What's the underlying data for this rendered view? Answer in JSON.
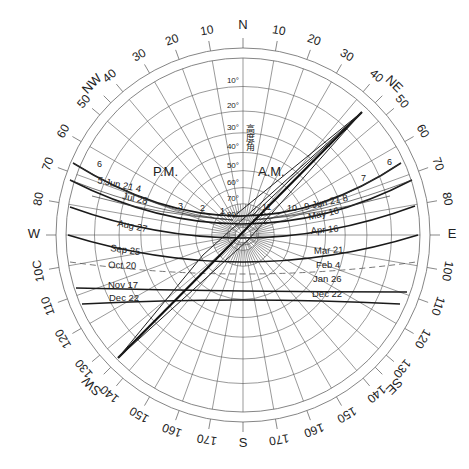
{
  "diagram": {
    "center": [
      243,
      235
    ],
    "outer_radius": 187,
    "inner_radius": 177,
    "compass_labels": [
      {
        "text": "N",
        "az": 0
      },
      {
        "text": "NE",
        "az": 45
      },
      {
        "text": "E",
        "az": 90
      },
      {
        "text": "SE",
        "az": 135
      },
      {
        "text": "S",
        "az": 180
      },
      {
        "text": "SW",
        "az": 225
      },
      {
        "text": "W",
        "az": 270
      },
      {
        "text": "NW",
        "az": 315
      }
    ],
    "azimuth_labels_east": [
      "10",
      "20",
      "30",
      "40",
      "50",
      "60",
      "70",
      "80",
      "100",
      "110",
      "120",
      "130",
      "140",
      "150",
      "160",
      "170"
    ],
    "azimuth_labels_west": [
      "10",
      "20",
      "30",
      "40",
      "50",
      "60",
      "70",
      "80",
      "10C",
      "110",
      "120",
      "130",
      "140",
      "150",
      "160",
      "170"
    ],
    "altitude_labels": [
      "10°",
      "20°",
      "30°",
      "40°",
      "50°",
      "60°",
      "70°",
      "80°"
    ],
    "altitude_axis_label": "高度角",
    "am_label": "A.M.",
    "pm_label": "P.M.",
    "date_labels_left": [
      {
        "text": "5 Jun 21 4",
        "x": 97,
        "y": 183,
        "rot": 12
      },
      {
        "text": "Jul 28",
        "x": 122,
        "y": 199,
        "rot": 12
      },
      {
        "text": "Aug 27",
        "x": 117,
        "y": 226,
        "rot": 12
      },
      {
        "text": "Sep 25",
        "x": 110,
        "y": 251,
        "rot": 8
      },
      {
        "text": "Oct 20",
        "x": 108,
        "y": 268,
        "rot": 2
      },
      {
        "text": "Nov 17",
        "x": 108,
        "y": 288,
        "rot": 0
      },
      {
        "text": "Dec 22",
        "x": 109,
        "y": 301,
        "rot": 0
      }
    ],
    "date_labels_right": [
      {
        "text": "9 Jun 21 8",
        "x": 305,
        "y": 210,
        "rot": -12
      },
      {
        "text": "May 16",
        "x": 309,
        "y": 220,
        "rot": -12
      },
      {
        "text": "Apr 16",
        "x": 311,
        "y": 234,
        "rot": -5
      },
      {
        "text": "Mar 21",
        "x": 314,
        "y": 254,
        "rot": -2
      },
      {
        "text": "Feb 4",
        "x": 316,
        "y": 268,
        "rot": 0
      },
      {
        "text": "Jan 26",
        "x": 313,
        "y": 282,
        "rot": 0
      },
      {
        "text": "Dec 22",
        "x": 312,
        "y": 297,
        "rot": 0
      }
    ],
    "hour_labels": [
      {
        "text": "6",
        "x": 97,
        "y": 167
      },
      {
        "text": "3",
        "x": 178,
        "y": 209
      },
      {
        "text": "2",
        "x": 200,
        "y": 211
      },
      {
        "text": "1",
        "x": 220,
        "y": 214
      },
      {
        "text": "11",
        "x": 262,
        "y": 210
      },
      {
        "text": "10",
        "x": 287,
        "y": 211
      },
      {
        "text": "7",
        "x": 361,
        "y": 181
      },
      {
        "text": "6",
        "x": 387,
        "y": 165
      }
    ]
  },
  "chart_data": {
    "type": "sun-path-diagram",
    "projection": "stereographic polar",
    "azimuth_range": [
      0,
      360
    ],
    "altitude_circles": [
      10,
      20,
      30,
      40,
      50,
      60,
      70,
      80
    ],
    "azimuth_gridlines_step": 10,
    "sun_paths": [
      {
        "date": "Jun 21",
        "left_end": [
          73,
          163
        ],
        "right_end": [
          401,
          163
        ],
        "low": [
          243,
          216
        ]
      },
      {
        "date": "Jul 28 / May 16",
        "left_end": [
          70,
          180
        ],
        "right_end": [
          412,
          180
        ],
        "low": [
          243,
          224
        ]
      },
      {
        "date": "Aug 27 / Apr 16",
        "left_end": [
          70,
          207
        ],
        "right_end": [
          415,
          206
        ],
        "low": [
          243,
          238
        ]
      },
      {
        "date": "Sep 25 / Mar 21",
        "left_end": [
          68,
          235
        ],
        "right_end": [
          418,
          235
        ],
        "low": [
          243,
          262
        ]
      },
      {
        "date": "Oct 20 / Feb 4",
        "left_end": [
          70,
          262
        ],
        "right_end": [
          416,
          262
        ],
        "low": [
          243,
          274
        ],
        "style": "dashed"
      },
      {
        "date": "Nov 17 / Jan 26",
        "left_end": [
          76,
          288
        ],
        "right_end": [
          407,
          292
        ],
        "low": [
          243,
          291
        ]
      },
      {
        "date": "Dec 22",
        "left_end": [
          82,
          304
        ],
        "right_end": [
          400,
          304
        ],
        "low": [
          243,
          300
        ]
      }
    ],
    "diagonal_indicator": {
      "from": [
        118,
        358
      ],
      "to": [
        362,
        112
      ]
    }
  }
}
